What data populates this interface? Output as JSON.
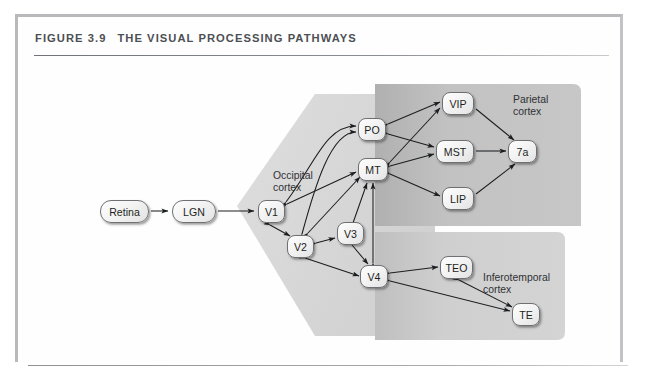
{
  "figure": {
    "number": "FIGURE 3.9",
    "title": "THE VISUAL PROCESSING PATHWAYS"
  },
  "regions": [
    {
      "id": "occipital",
      "label": "Occipital\ncortex",
      "fill": "#d8d8d8"
    },
    {
      "id": "parietal",
      "label": "Parietal\ncortex",
      "fill": "#c2c2c2"
    },
    {
      "id": "inferotemporal",
      "label": "Inferotemporal\ncortex",
      "fill": "#cfcfcf"
    }
  ],
  "nodes": [
    {
      "id": "retina",
      "label": "Retina",
      "x": 85,
      "y": 186,
      "w": 49,
      "h": 23,
      "shape": "pill"
    },
    {
      "id": "lgn",
      "label": "LGN",
      "x": 157,
      "y": 186,
      "w": 44,
      "h": 23,
      "shape": "pill"
    },
    {
      "id": "v1",
      "label": "V1",
      "x": 243,
      "y": 186,
      "w": 27,
      "h": 23,
      "shape": "rounded"
    },
    {
      "id": "v2",
      "label": "V2",
      "x": 272,
      "y": 221,
      "w": 27,
      "h": 23,
      "shape": "rounded"
    },
    {
      "id": "v3",
      "label": "V3",
      "x": 322,
      "y": 208,
      "w": 27,
      "h": 23,
      "shape": "rounded"
    },
    {
      "id": "v4",
      "label": "V4",
      "x": 345,
      "y": 251,
      "w": 28,
      "h": 23,
      "shape": "rounded"
    },
    {
      "id": "mt",
      "label": "MT",
      "x": 343,
      "y": 144,
      "w": 30,
      "h": 23,
      "shape": "rounded"
    },
    {
      "id": "po",
      "label": "PO",
      "x": 343,
      "y": 104,
      "w": 28,
      "h": 23,
      "shape": "rounded"
    },
    {
      "id": "vip",
      "label": "VIP",
      "x": 427,
      "y": 78,
      "w": 32,
      "h": 23,
      "shape": "rounded"
    },
    {
      "id": "mst",
      "label": "MST",
      "x": 421,
      "y": 126,
      "w": 38,
      "h": 23,
      "shape": "rounded"
    },
    {
      "id": "lip",
      "label": "LIP",
      "x": 427,
      "y": 173,
      "w": 32,
      "h": 23,
      "shape": "rounded"
    },
    {
      "id": "7a",
      "label": "7a",
      "x": 493,
      "y": 126,
      "w": 29,
      "h": 23,
      "shape": "rounded"
    },
    {
      "id": "teo",
      "label": "TEO",
      "x": 425,
      "y": 242,
      "w": 33,
      "h": 23,
      "shape": "rounded"
    },
    {
      "id": "te",
      "label": "TE",
      "x": 497,
      "y": 289,
      "w": 28,
      "h": 23,
      "shape": "rounded"
    }
  ],
  "edges": [
    {
      "from": "retina",
      "to": "lgn",
      "bidirectional": false
    },
    {
      "from": "lgn",
      "to": "v1",
      "bidirectional": false
    },
    {
      "from": "v1",
      "to": "v2",
      "bidirectional": true
    },
    {
      "from": "v2",
      "to": "v3",
      "bidirectional": true
    },
    {
      "from": "v1",
      "to": "mt",
      "bidirectional": true
    },
    {
      "from": "v1",
      "to": "po",
      "bidirectional": true
    },
    {
      "from": "v2",
      "to": "mt",
      "bidirectional": true
    },
    {
      "from": "v2",
      "to": "po",
      "bidirectional": true
    },
    {
      "from": "v2",
      "to": "v4",
      "bidirectional": true
    },
    {
      "from": "v3",
      "to": "mt",
      "bidirectional": true
    },
    {
      "from": "v3",
      "to": "v4",
      "bidirectional": true
    },
    {
      "from": "v4",
      "to": "mt",
      "bidirectional": true
    },
    {
      "from": "mt",
      "to": "vip",
      "bidirectional": true
    },
    {
      "from": "mt",
      "to": "mst",
      "bidirectional": true
    },
    {
      "from": "mt",
      "to": "lip",
      "bidirectional": true
    },
    {
      "from": "po",
      "to": "vip",
      "bidirectional": true
    },
    {
      "from": "po",
      "to": "mst",
      "bidirectional": true
    },
    {
      "from": "vip",
      "to": "7a",
      "bidirectional": false
    },
    {
      "from": "mst",
      "to": "7a",
      "bidirectional": false
    },
    {
      "from": "lip",
      "to": "7a",
      "bidirectional": false
    },
    {
      "from": "v4",
      "to": "teo",
      "bidirectional": true
    },
    {
      "from": "v4",
      "to": "te",
      "bidirectional": true
    },
    {
      "from": "teo",
      "to": "te",
      "bidirectional": true
    }
  ]
}
